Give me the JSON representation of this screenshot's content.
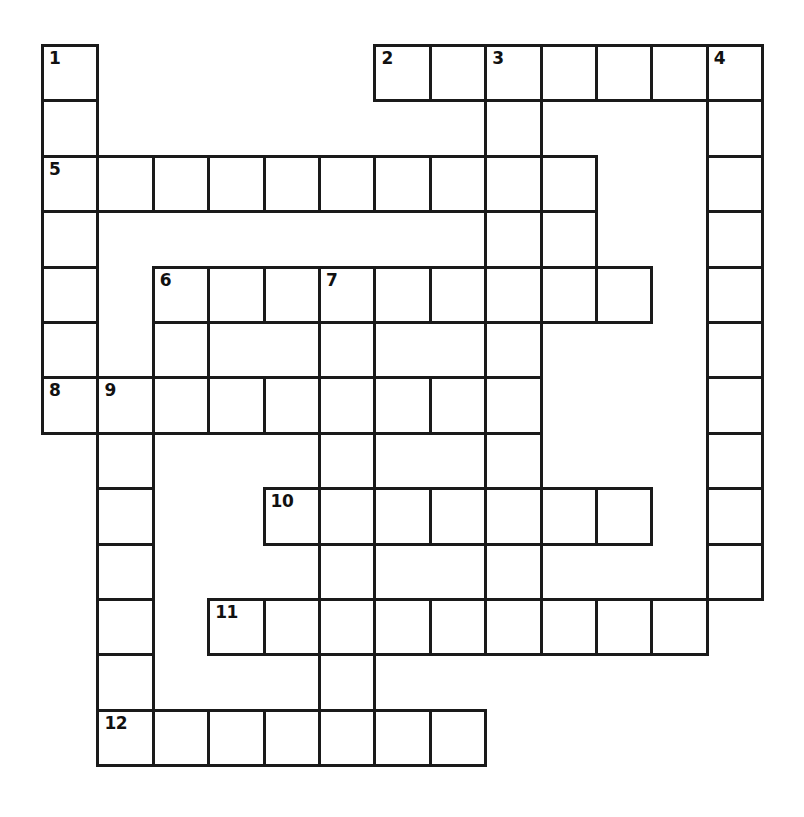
{
  "puzzle": {
    "type": "crossword-grid",
    "title": "",
    "columns": 13,
    "rows": 13,
    "cell_size": 55.4,
    "origin_x": 41,
    "origin_y": 44,
    "border_color": "#1a1a1a",
    "cell_fill": "#ffffff",
    "background": "#ffffff",
    "number_color": "#111111",
    "entry_count": 12,
    "cells": [
      {
        "row": 0,
        "col": 0,
        "number": "1",
        "letter": ""
      },
      {
        "row": 0,
        "col": 6,
        "number": "2",
        "letter": ""
      },
      {
        "row": 0,
        "col": 7,
        "number": "",
        "letter": ""
      },
      {
        "row": 0,
        "col": 8,
        "number": "3",
        "letter": ""
      },
      {
        "row": 0,
        "col": 9,
        "number": "",
        "letter": ""
      },
      {
        "row": 0,
        "col": 10,
        "number": "",
        "letter": ""
      },
      {
        "row": 0,
        "col": 11,
        "number": "",
        "letter": ""
      },
      {
        "row": 0,
        "col": 12,
        "number": "4",
        "letter": ""
      },
      {
        "row": 1,
        "col": 0,
        "number": "",
        "letter": ""
      },
      {
        "row": 1,
        "col": 8,
        "number": "",
        "letter": ""
      },
      {
        "row": 1,
        "col": 12,
        "number": "",
        "letter": ""
      },
      {
        "row": 2,
        "col": 0,
        "number": "5",
        "letter": ""
      },
      {
        "row": 2,
        "col": 1,
        "number": "",
        "letter": ""
      },
      {
        "row": 2,
        "col": 2,
        "number": "",
        "letter": ""
      },
      {
        "row": 2,
        "col": 3,
        "number": "",
        "letter": ""
      },
      {
        "row": 2,
        "col": 4,
        "number": "",
        "letter": ""
      },
      {
        "row": 2,
        "col": 5,
        "number": "",
        "letter": ""
      },
      {
        "row": 2,
        "col": 6,
        "number": "",
        "letter": ""
      },
      {
        "row": 2,
        "col": 7,
        "number": "",
        "letter": ""
      },
      {
        "row": 2,
        "col": 8,
        "number": "",
        "letter": ""
      },
      {
        "row": 2,
        "col": 9,
        "number": "",
        "letter": ""
      },
      {
        "row": 2,
        "col": 12,
        "number": "",
        "letter": ""
      },
      {
        "row": 3,
        "col": 0,
        "number": "",
        "letter": ""
      },
      {
        "row": 3,
        "col": 8,
        "number": "",
        "letter": ""
      },
      {
        "row": 3,
        "col": 9,
        "number": "",
        "letter": ""
      },
      {
        "row": 3,
        "col": 12,
        "number": "",
        "letter": ""
      },
      {
        "row": 4,
        "col": 0,
        "number": "",
        "letter": ""
      },
      {
        "row": 4,
        "col": 2,
        "number": "6",
        "letter": ""
      },
      {
        "row": 4,
        "col": 3,
        "number": "",
        "letter": ""
      },
      {
        "row": 4,
        "col": 4,
        "number": "",
        "letter": ""
      },
      {
        "row": 4,
        "col": 5,
        "number": "7",
        "letter": ""
      },
      {
        "row": 4,
        "col": 6,
        "number": "",
        "letter": ""
      },
      {
        "row": 4,
        "col": 7,
        "number": "",
        "letter": ""
      },
      {
        "row": 4,
        "col": 8,
        "number": "",
        "letter": ""
      },
      {
        "row": 4,
        "col": 9,
        "number": "",
        "letter": ""
      },
      {
        "row": 4,
        "col": 10,
        "number": "",
        "letter": ""
      },
      {
        "row": 4,
        "col": 12,
        "number": "",
        "letter": ""
      },
      {
        "row": 5,
        "col": 0,
        "number": "",
        "letter": ""
      },
      {
        "row": 5,
        "col": 2,
        "number": "",
        "letter": ""
      },
      {
        "row": 5,
        "col": 5,
        "number": "",
        "letter": ""
      },
      {
        "row": 5,
        "col": 8,
        "number": "",
        "letter": ""
      },
      {
        "row": 5,
        "col": 12,
        "number": "",
        "letter": ""
      },
      {
        "row": 6,
        "col": 0,
        "number": "8",
        "letter": ""
      },
      {
        "row": 6,
        "col": 1,
        "number": "9",
        "letter": ""
      },
      {
        "row": 6,
        "col": 2,
        "number": "",
        "letter": ""
      },
      {
        "row": 6,
        "col": 3,
        "number": "",
        "letter": ""
      },
      {
        "row": 6,
        "col": 4,
        "number": "",
        "letter": ""
      },
      {
        "row": 6,
        "col": 5,
        "number": "",
        "letter": ""
      },
      {
        "row": 6,
        "col": 6,
        "number": "",
        "letter": ""
      },
      {
        "row": 6,
        "col": 7,
        "number": "",
        "letter": ""
      },
      {
        "row": 6,
        "col": 8,
        "number": "",
        "letter": ""
      },
      {
        "row": 6,
        "col": 12,
        "number": "",
        "letter": ""
      },
      {
        "row": 7,
        "col": 1,
        "number": "",
        "letter": ""
      },
      {
        "row": 7,
        "col": 5,
        "number": "",
        "letter": ""
      },
      {
        "row": 7,
        "col": 8,
        "number": "",
        "letter": ""
      },
      {
        "row": 7,
        "col": 12,
        "number": "",
        "letter": ""
      },
      {
        "row": 8,
        "col": 1,
        "number": "",
        "letter": ""
      },
      {
        "row": 8,
        "col": 4,
        "number": "10",
        "letter": ""
      },
      {
        "row": 8,
        "col": 5,
        "number": "",
        "letter": ""
      },
      {
        "row": 8,
        "col": 6,
        "number": "",
        "letter": ""
      },
      {
        "row": 8,
        "col": 7,
        "number": "",
        "letter": ""
      },
      {
        "row": 8,
        "col": 8,
        "number": "",
        "letter": ""
      },
      {
        "row": 8,
        "col": 9,
        "number": "",
        "letter": ""
      },
      {
        "row": 8,
        "col": 10,
        "number": "",
        "letter": ""
      },
      {
        "row": 8,
        "col": 12,
        "number": "",
        "letter": ""
      },
      {
        "row": 9,
        "col": 1,
        "number": "",
        "letter": ""
      },
      {
        "row": 9,
        "col": 5,
        "number": "",
        "letter": ""
      },
      {
        "row": 9,
        "col": 8,
        "number": "",
        "letter": ""
      },
      {
        "row": 9,
        "col": 12,
        "number": "",
        "letter": ""
      },
      {
        "row": 10,
        "col": 1,
        "number": "",
        "letter": ""
      },
      {
        "row": 10,
        "col": 3,
        "number": "11",
        "letter": ""
      },
      {
        "row": 10,
        "col": 4,
        "number": "",
        "letter": ""
      },
      {
        "row": 10,
        "col": 5,
        "number": "",
        "letter": ""
      },
      {
        "row": 10,
        "col": 6,
        "number": "",
        "letter": ""
      },
      {
        "row": 10,
        "col": 7,
        "number": "",
        "letter": ""
      },
      {
        "row": 10,
        "col": 8,
        "number": "",
        "letter": ""
      },
      {
        "row": 10,
        "col": 9,
        "number": "",
        "letter": ""
      },
      {
        "row": 10,
        "col": 10,
        "number": "",
        "letter": ""
      },
      {
        "row": 10,
        "col": 11,
        "number": "",
        "letter": ""
      },
      {
        "row": 11,
        "col": 1,
        "number": "",
        "letter": ""
      },
      {
        "row": 11,
        "col": 5,
        "number": "",
        "letter": ""
      },
      {
        "row": 12,
        "col": 1,
        "number": "12",
        "letter": ""
      },
      {
        "row": 12,
        "col": 2,
        "number": "",
        "letter": ""
      },
      {
        "row": 12,
        "col": 3,
        "number": "",
        "letter": ""
      },
      {
        "row": 12,
        "col": 4,
        "number": "",
        "letter": ""
      },
      {
        "row": 12,
        "col": 5,
        "number": "",
        "letter": ""
      },
      {
        "row": 12,
        "col": 6,
        "number": "",
        "letter": ""
      },
      {
        "row": 12,
        "col": 7,
        "number": "",
        "letter": ""
      }
    ]
  }
}
